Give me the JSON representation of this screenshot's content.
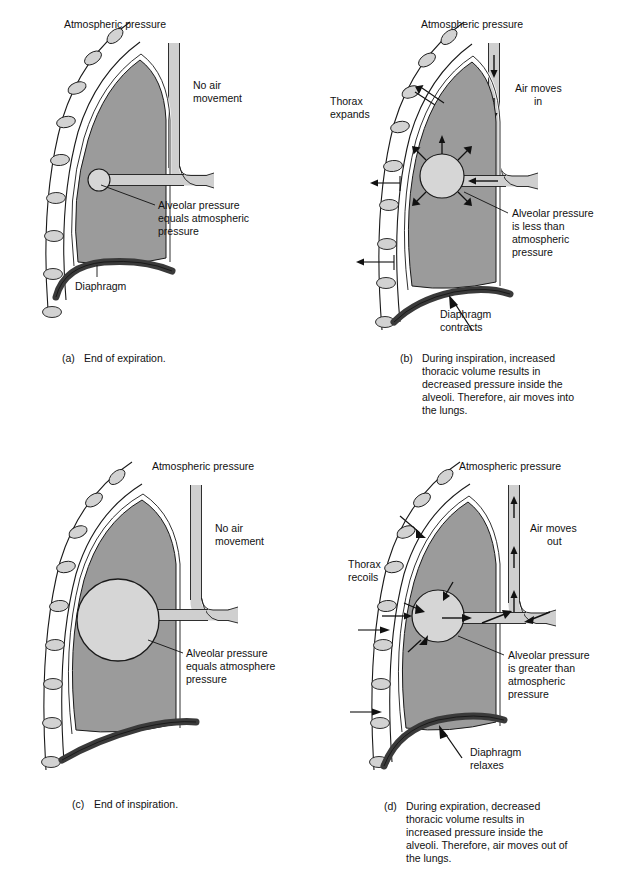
{
  "figure": {
    "colors": {
      "lung": "#9b9b9b",
      "rib": "#d2d2d2",
      "airway": "#cfcfcf",
      "alveolus": "#d6d6d6",
      "diaphragm": "#3a3a3a",
      "outline": "#1a1a1a",
      "text": "#111111",
      "background": "#ffffff"
    }
  },
  "panels": [
    {
      "id": "a",
      "letter": "(a)",
      "caption": "End of expiration.",
      "caption_lines": [
        "End of expiration."
      ],
      "labels": {
        "atmospheric_pressure": "Atmospheric pressure",
        "air_movement": [
          "No air",
          "movement"
        ],
        "alveolar": [
          "Alveolar pressure",
          "equals atmospheric",
          "pressure"
        ],
        "diaphragm": [
          "Diaphragm"
        ]
      },
      "state": {
        "alveolus_size": "small",
        "airflow": "none",
        "diaphragm": "relaxed-domed",
        "thorax": "resting"
      }
    },
    {
      "id": "b",
      "letter": "(b)",
      "caption": "During inspiration, increased thoracic volume results in decreased pressure inside the alveoli. Therefore, air moves into the lungs.",
      "caption_lines": [
        "During inspiration, increased",
        "thoracic volume results in",
        "decreased pressure inside the",
        "alveoli. Therefore, air moves into",
        "the lungs."
      ],
      "labels": {
        "atmospheric_pressure": "Atmospheric pressure",
        "air_movement": [
          "Air moves",
          "in"
        ],
        "thorax": [
          "Thorax",
          "expands"
        ],
        "alveolar": [
          "Alveolar pressure",
          "is less than",
          "atmospheric",
          "pressure"
        ],
        "diaphragm": [
          "Diaphragm",
          "contracts"
        ]
      },
      "state": {
        "alveolus_size": "medium",
        "airflow": "in",
        "diaphragm": "contracting-flattening",
        "thorax": "expanding"
      }
    },
    {
      "id": "c",
      "letter": "(c)",
      "caption": "End of inspiration.",
      "caption_lines": [
        "End of inspiration."
      ],
      "labels": {
        "atmospheric_pressure": "Atmospheric pressure",
        "air_movement": [
          "No air",
          "movement"
        ],
        "alveolar": [
          "Alveolar pressure",
          "equals atmosphere",
          "pressure"
        ]
      },
      "state": {
        "alveolus_size": "large",
        "airflow": "none",
        "diaphragm": "flattened",
        "thorax": "expanded"
      }
    },
    {
      "id": "d",
      "letter": "(d)",
      "caption": "During expiration, decreased thoracic volume results in increased pressure inside the alveoli. Therefore, air moves out of the lungs.",
      "caption_lines": [
        "During expiration, decreased",
        "thoracic volume results in",
        "increased pressure inside the",
        "alveoli. Therefore, air moves out of",
        "the lungs."
      ],
      "labels": {
        "atmospheric_pressure": "Atmospheric pressure",
        "air_movement": [
          "Air moves",
          "out"
        ],
        "thorax": [
          "Thorax",
          "recoils"
        ],
        "alveolar": [
          "Alveolar pressure",
          "is greater than",
          "atmospheric",
          "pressure"
        ],
        "diaphragm": [
          "Diaphragm",
          "relaxes"
        ]
      },
      "state": {
        "alveolus_size": "medium",
        "airflow": "out",
        "diaphragm": "relaxing-doming",
        "thorax": "recoiling"
      }
    }
  ]
}
